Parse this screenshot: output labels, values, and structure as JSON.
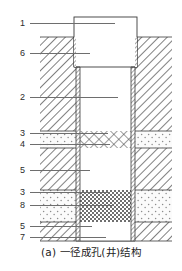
{
  "figure": {
    "caption": "(a) 一径成孔(井)结构",
    "type": "engineering-cross-section",
    "callouts": [
      {
        "num": "1",
        "y": 18,
        "leader_x": 16,
        "leader_w": 85,
        "name": "well-head-casing"
      },
      {
        "num": "6",
        "y": 48,
        "leader_x": 16,
        "leader_w": 60,
        "name": "surface-seal"
      },
      {
        "num": "2",
        "y": 92,
        "leader_x": 16,
        "leader_w": 88,
        "name": "blank-casing-pipe"
      },
      {
        "num": "3",
        "y": 128,
        "leader_x": 16,
        "leader_w": 78,
        "name": "upper-aquifer-layer"
      },
      {
        "num": "4",
        "y": 139,
        "leader_x": 16,
        "leader_w": 80,
        "name": "well-screen"
      },
      {
        "num": "5",
        "y": 165,
        "leader_x": 16,
        "leader_w": 60,
        "name": "aquiclude-layer"
      },
      {
        "num": "3",
        "y": 187,
        "leader_x": 16,
        "leader_w": 78,
        "name": "lower-aquifer-layer"
      },
      {
        "num": "8",
        "y": 200,
        "leader_x": 16,
        "leader_w": 84,
        "name": "gravel-filter-pack"
      },
      {
        "num": "5",
        "y": 221,
        "leader_x": 16,
        "leader_w": 62,
        "name": "bottom-aquiclude-layer"
      },
      {
        "num": "7",
        "y": 232,
        "leader_x": 16,
        "leader_w": 76,
        "name": "sediment-sump"
      }
    ],
    "geometry": {
      "diagram_left": 40,
      "diagram_right": 172,
      "ground_surface_y": 37,
      "bottom_y": 241,
      "casing_head": {
        "x": 74,
        "y": 17,
        "w": 63,
        "h": 50
      },
      "casing_wall_left_x": 76,
      "casing_wall_right_x": 131,
      "casing_wall_thickness": 4,
      "borehole_inner_left": 80,
      "borehole_inner_right": 131
    },
    "layers": [
      {
        "name": "surface-fill",
        "y0": 37,
        "y1": 131,
        "pattern": "diagonal-hatch"
      },
      {
        "name": "upper-aquifer",
        "y0": 131,
        "y1": 148,
        "pattern": "dotted-sand"
      },
      {
        "name": "aquiclude",
        "y0": 148,
        "y1": 190,
        "pattern": "diagonal-hatch"
      },
      {
        "name": "lower-aquifer",
        "y0": 190,
        "y1": 222,
        "pattern": "dotted-sand"
      },
      {
        "name": "bottom-aquiclude",
        "y0": 222,
        "y1": 241,
        "pattern": "diagonal-hatch"
      }
    ],
    "well_fills": [
      {
        "name": "screen-section",
        "y0": 131,
        "y1": 148,
        "pattern": "cross-hatch"
      },
      {
        "name": "open-hole-section",
        "y0": 148,
        "y1": 190,
        "pattern": "white"
      },
      {
        "name": "filter-pack-section",
        "y0": 190,
        "y1": 222,
        "pattern": "dark-checker"
      },
      {
        "name": "sump-section",
        "y0": 222,
        "y1": 241,
        "pattern": "white"
      }
    ]
  }
}
